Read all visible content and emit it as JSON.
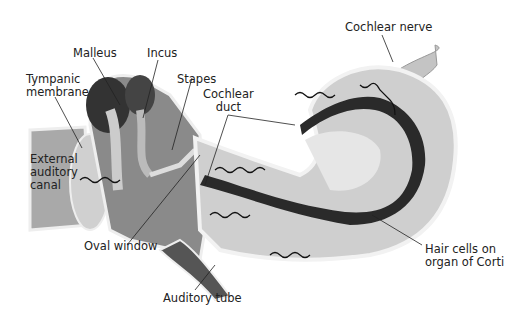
{
  "figure": {
    "labels": {
      "malleus": "Malleus",
      "incus": "Incus",
      "tympanic_membrane": "Tympanic\nmembrane",
      "stapes": "Stapes",
      "cochlear_duct": "Cochlear\nduct",
      "external_auditory_canal": "External\nauditory\ncanal",
      "oval_window": "Oval window",
      "auditory_tube": "Auditory tube",
      "cochlear_nerve": "Cochlear nerve",
      "hair_cells": "Hair cells on\norgan of Corti"
    },
    "colors": {
      "background": "#ffffff",
      "canal_fill": "#a9a9a9",
      "dark_fill": "#555555",
      "light_fill": "#d8d8d8",
      "outline": "#f2f2f2",
      "duct_dark": "#2a2a2a",
      "text": "#222222"
    }
  }
}
